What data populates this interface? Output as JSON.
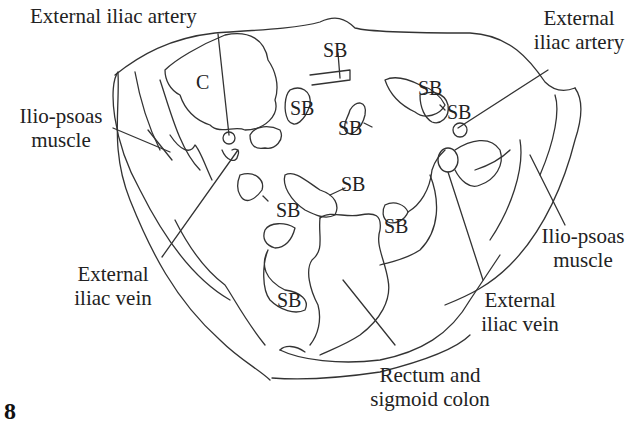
{
  "figure": {
    "number": "8",
    "type": "anatomical line drawing - axial pelvic cross-section",
    "stroke_color": "#333333",
    "background": "#ffffff"
  },
  "labels": {
    "ext_iliac_artery_left": "External iliac artery",
    "ext_iliac_artery_right_l1": "External",
    "ext_iliac_artery_right_l2": "iliac artery",
    "iliopsoas_left_l1": "Ilio-psoas",
    "iliopsoas_left_l2": "muscle",
    "iliopsoas_right_l1": "Ilio-psoas",
    "iliopsoas_right_l2": "muscle",
    "ext_iliac_vein_left_l1": "External",
    "ext_iliac_vein_left_l2": "iliac vein",
    "ext_iliac_vein_right_l1": "External",
    "ext_iliac_vein_right_l2": "iliac vein",
    "rectum_l1": "Rectum and",
    "rectum_l2": "sigmoid colon"
  },
  "organ_marks": {
    "cecum": "C",
    "small_bowel": "SB"
  }
}
